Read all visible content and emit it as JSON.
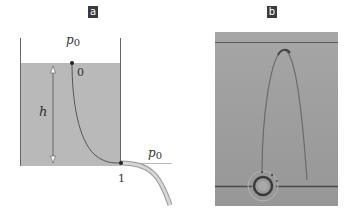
{
  "figure": {
    "panels": [
      {
        "label": "a",
        "description": "Tank with outflow tube (Bernoulli / Torricelli setup)",
        "labels": {
          "pressure_top": "p",
          "pressure_top_sub": "0",
          "pressure_right": "p",
          "pressure_right_sub": "0",
          "point_surface": "0",
          "point_outlet": "1",
          "height": "h"
        },
        "colors": {
          "water": "#b9b9b9",
          "walls": "#555555",
          "streamline": "#555555",
          "tube": "#c8c8c8",
          "points": "#222222"
        }
      },
      {
        "label": "b",
        "description": "Photograph of a streamline trajectory in a gray fluid with a ring outlet",
        "colors": {
          "photo_background": "#9c9c9c",
          "lines": "#4a4a4a"
        }
      }
    ]
  }
}
